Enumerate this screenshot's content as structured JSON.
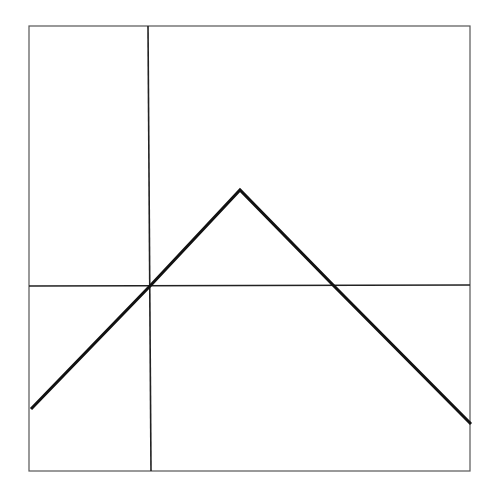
{
  "chart_data": {
    "type": "line",
    "title": "",
    "xlabel": "",
    "ylabel": "",
    "grid": false,
    "legend": null,
    "axes_px": {
      "x_axis_y": 286,
      "y_axis_x": 150
    },
    "frame_px": {
      "left": 29,
      "top": 26,
      "right": 470,
      "bottom": 471
    },
    "series": [
      {
        "name": "f(x)",
        "points_px": [
          [
            31,
            409
          ],
          [
            150,
            286
          ],
          [
            240,
            190
          ],
          [
            334,
            286
          ],
          [
            471,
            424
          ]
        ],
        "points_relative": [
          {
            "x": -1.24,
            "y": -1.28
          },
          {
            "x": 0,
            "y": 0
          },
          {
            "x": 0.94,
            "y": 1.0
          },
          {
            "x": 1.92,
            "y": 0
          },
          {
            "x": 3.35,
            "y": -1.44
          }
        ]
      }
    ],
    "colors": {
      "line": "#111111",
      "axes": "#222222",
      "frame": "#555555",
      "background": "#ffffff"
    }
  }
}
